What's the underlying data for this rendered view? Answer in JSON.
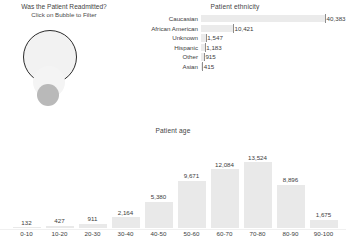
{
  "bubble_filter": {
    "title_line1": "Was the Patient Readmitted?",
    "title_line2": "Click on Bubble to Filter",
    "bubbles": [
      {
        "name": "bubble-large-outlined",
        "fill": "#f2f2f2",
        "stroke": "#2b2b2b"
      },
      {
        "name": "bubble-medium-ghost",
        "fill": "#f4f4f4",
        "stroke": "none"
      },
      {
        "name": "bubble-small-solid",
        "fill": "#b9b9b9",
        "stroke": "none"
      }
    ]
  },
  "ethnicity": {
    "title": "Patient ethnicity",
    "max_value": 40383,
    "rows": [
      {
        "label": "Caucasian",
        "value": 40383,
        "value_label": "40,383"
      },
      {
        "label": "African American",
        "value": 10421,
        "value_label": "10,421"
      },
      {
        "label": "Unknown",
        "value": 1547,
        "value_label": "1,547"
      },
      {
        "label": "Hispanic",
        "value": 1183,
        "value_label": "1,183"
      },
      {
        "label": "Other",
        "value": 915,
        "value_label": "915"
      },
      {
        "label": "Asian",
        "value": 415,
        "value_label": "415"
      }
    ]
  },
  "age": {
    "title": "Patient age"
  },
  "chart_data": [
    {
      "type": "bar",
      "orientation": "horizontal",
      "title": "Patient ethnicity",
      "xlabel": "",
      "ylabel": "",
      "categories": [
        "Caucasian",
        "African American",
        "Unknown",
        "Hispanic",
        "Other",
        "Asian"
      ],
      "values": [
        40383,
        10421,
        1547,
        1183,
        915,
        415
      ],
      "value_labels": [
        "40,383",
        "10,421",
        "1,547",
        "1,183",
        "915",
        "415"
      ],
      "xlim": [
        0,
        40383
      ],
      "grid": false,
      "legend": "none",
      "bar_color": "#ebebeb"
    },
    {
      "type": "bar",
      "orientation": "vertical",
      "title": "Patient age",
      "xlabel": "",
      "ylabel": "",
      "categories": [
        "0-10",
        "10-20",
        "20-30",
        "30-40",
        "40-50",
        "50-60",
        "60-70",
        "70-80",
        "80-90",
        "90-100"
      ],
      "values": [
        132,
        427,
        911,
        2164,
        5380,
        9671,
        12084,
        13524,
        8896,
        1675
      ],
      "value_labels": [
        "132",
        "427",
        "911",
        "2,164",
        "5,380",
        "9,671",
        "12,084",
        "13,524",
        "8,896",
        "1,675"
      ],
      "ylim": [
        0,
        13524
      ],
      "grid": false,
      "legend": "none",
      "bar_color": "#e9e9e9"
    }
  ],
  "footer": {
    "cut_off_text": ""
  }
}
